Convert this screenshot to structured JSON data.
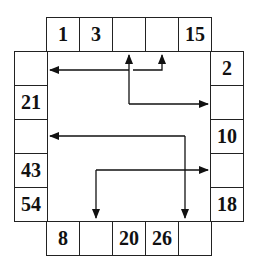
{
  "puzzle": {
    "top_row": [
      "1",
      "3",
      "",
      "",
      "15"
    ],
    "left_col": [
      "",
      "21",
      "",
      "43",
      "54"
    ],
    "right_col": [
      "2",
      "",
      "10",
      "",
      "18"
    ],
    "bottom_row": [
      "8",
      "",
      "20",
      "26",
      ""
    ]
  },
  "arrows": [
    {
      "from": "top-3",
      "to": "left-1",
      "via": "horizontal"
    },
    {
      "from": "junction",
      "to": "top-4",
      "via": "up"
    },
    {
      "from": "top-3",
      "to": "right-2",
      "via": "down-then-right"
    },
    {
      "from": "bottom-5",
      "to": "left-3",
      "via": "up-then-left"
    },
    {
      "from": "bottom-2",
      "to": "right-4",
      "via": "up-then-right"
    }
  ]
}
